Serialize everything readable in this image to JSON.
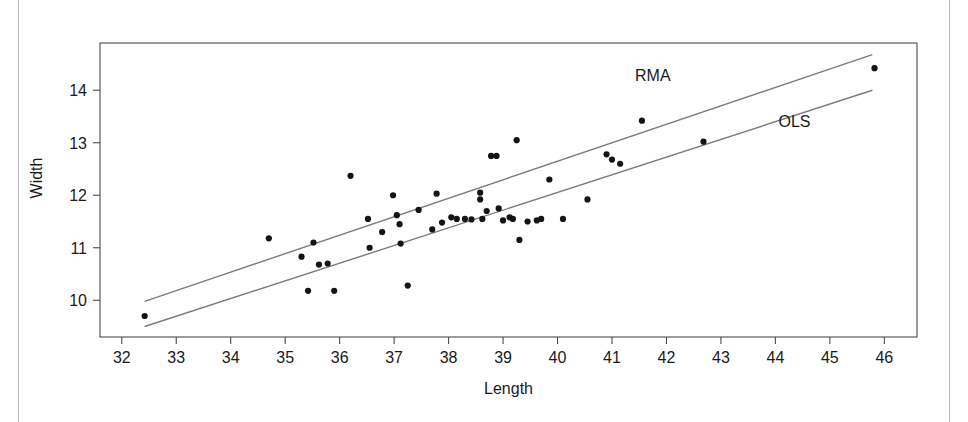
{
  "chart_data": {
    "type": "scatter",
    "title": "",
    "xlabel": "Length",
    "ylabel": "Width",
    "xlim": [
      31.6,
      46.6
    ],
    "ylim": [
      9.3,
      14.9
    ],
    "grid": false,
    "legend_position": "inline-right",
    "x_ticks": [
      32,
      33,
      34,
      35,
      36,
      37,
      38,
      39,
      40,
      41,
      42,
      43,
      44,
      45,
      46
    ],
    "y_ticks": [
      10,
      11,
      12,
      13,
      14
    ],
    "points": [
      {
        "x": 32.42,
        "y": 9.7
      },
      {
        "x": 34.7,
        "y": 11.18
      },
      {
        "x": 35.3,
        "y": 10.83
      },
      {
        "x": 35.42,
        "y": 10.18
      },
      {
        "x": 35.52,
        "y": 11.1
      },
      {
        "x": 35.62,
        "y": 10.68
      },
      {
        "x": 35.78,
        "y": 10.7
      },
      {
        "x": 35.9,
        "y": 10.18
      },
      {
        "x": 36.2,
        "y": 12.37
      },
      {
        "x": 36.52,
        "y": 11.55
      },
      {
        "x": 36.55,
        "y": 11.0
      },
      {
        "x": 36.78,
        "y": 11.3
      },
      {
        "x": 36.98,
        "y": 12.0
      },
      {
        "x": 37.05,
        "y": 11.62
      },
      {
        "x": 37.1,
        "y": 11.45
      },
      {
        "x": 37.12,
        "y": 11.08
      },
      {
        "x": 37.25,
        "y": 10.28
      },
      {
        "x": 37.45,
        "y": 11.72
      },
      {
        "x": 37.7,
        "y": 11.35
      },
      {
        "x": 37.78,
        "y": 12.03
      },
      {
        "x": 37.88,
        "y": 11.48
      },
      {
        "x": 38.05,
        "y": 11.58
      },
      {
        "x": 38.15,
        "y": 11.55
      },
      {
        "x": 38.3,
        "y": 11.55
      },
      {
        "x": 38.42,
        "y": 11.54
      },
      {
        "x": 38.58,
        "y": 12.05
      },
      {
        "x": 38.58,
        "y": 11.92
      },
      {
        "x": 38.62,
        "y": 11.55
      },
      {
        "x": 38.7,
        "y": 11.7
      },
      {
        "x": 38.78,
        "y": 12.75
      },
      {
        "x": 38.88,
        "y": 12.75
      },
      {
        "x": 38.92,
        "y": 11.75
      },
      {
        "x": 39.0,
        "y": 11.52
      },
      {
        "x": 39.12,
        "y": 11.58
      },
      {
        "x": 39.18,
        "y": 11.55
      },
      {
        "x": 39.25,
        "y": 13.05
      },
      {
        "x": 39.3,
        "y": 11.15
      },
      {
        "x": 39.45,
        "y": 11.5
      },
      {
        "x": 39.62,
        "y": 11.52
      },
      {
        "x": 39.7,
        "y": 11.55
      },
      {
        "x": 39.85,
        "y": 12.3
      },
      {
        "x": 40.1,
        "y": 11.55
      },
      {
        "x": 40.55,
        "y": 11.92
      },
      {
        "x": 40.9,
        "y": 12.78
      },
      {
        "x": 41.0,
        "y": 12.68
      },
      {
        "x": 41.15,
        "y": 12.6
      },
      {
        "x": 41.55,
        "y": 13.42
      },
      {
        "x": 42.68,
        "y": 13.02
      },
      {
        "x": 45.82,
        "y": 14.42
      }
    ],
    "fit_lines": [
      {
        "name": "RMA",
        "label": "RMA",
        "x_start": 32.42,
        "y_start": 9.98,
        "x_end": 45.78,
        "y_end": 14.68,
        "label_x": 41.75,
        "label_y": 14.18
      },
      {
        "name": "OLS",
        "label": "OLS",
        "x_start": 32.42,
        "y_start": 9.5,
        "x_end": 45.78,
        "y_end": 14.0,
        "label_x": 44.35,
        "label_y": 13.3
      }
    ],
    "colors": {
      "point": "#141414",
      "line": "#7b7b7b",
      "axis": "#4a4a4a",
      "text": "#1a1a1a",
      "background": "#ffffff"
    }
  }
}
